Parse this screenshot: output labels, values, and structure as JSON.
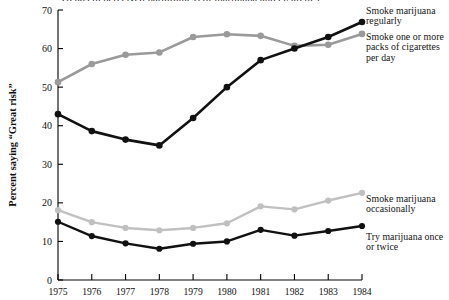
{
  "chart_data": {
    "type": "line",
    "title": "Trends in perceived harmfulness of marijuana and cigarettes",
    "xlabel": "",
    "ylabel": "Percent saying “Great risk”",
    "x": [
      1975,
      1976,
      1977,
      1978,
      1979,
      1980,
      1981,
      1982,
      1983,
      1984
    ],
    "xtick_labels": [
      "1975",
      "1976",
      "1977",
      "1978",
      "1979",
      "1980",
      "1981",
      "1982",
      "1983",
      "1984"
    ],
    "ytick_labels": [
      "0",
      "10",
      "20",
      "30",
      "40",
      "50",
      "60",
      "70"
    ],
    "yticks": [
      0,
      10,
      20,
      30,
      40,
      50,
      60,
      70
    ],
    "ylim": [
      0,
      70
    ],
    "xlim": [
      1975,
      1984
    ],
    "grid": false,
    "legend_position": "right-annotations",
    "series": [
      {
        "name": "Smoke marijuana regularly",
        "color": "#111111",
        "marker": "circle",
        "values": [
          43.0,
          38.6,
          36.4,
          34.9,
          42.0,
          50.0,
          57.0,
          60.0,
          63.0,
          66.9
        ]
      },
      {
        "name": "Smoke one or more packs of cigarettes per day",
        "color": "#9a9a9a",
        "marker": "circle",
        "values": [
          51.3,
          56.0,
          58.4,
          59.0,
          63.0,
          63.7,
          63.3,
          60.7,
          61.0,
          63.8
        ]
      },
      {
        "name": "Smoke marijuana occasionally",
        "color": "#c0c0c0",
        "marker": "circle",
        "values": [
          18.1,
          15.0,
          13.5,
          12.9,
          13.5,
          14.7,
          19.1,
          18.3,
          20.6,
          22.6
        ]
      },
      {
        "name": "Try marijuana once or twice",
        "color": "#111111",
        "marker": "circle",
        "values": [
          15.1,
          11.4,
          9.5,
          8.1,
          9.4,
          10.0,
          13.0,
          11.5,
          12.7,
          14.0
        ]
      }
    ]
  },
  "legend": {
    "item1_line1": "Smoke marijuana",
    "item1_line2": "regularly",
    "item2_line1": "Smoke one or more",
    "item2_line2": "packs of cigarettes",
    "item2_line3": "per day",
    "item3_line1": "Smoke marijuana",
    "item3_line2": "occasionally",
    "item4_line1": "Try marijuana once",
    "item4_line2": "or twice"
  },
  "axes": {
    "ylabel": "Percent saying “Great risk”"
  }
}
